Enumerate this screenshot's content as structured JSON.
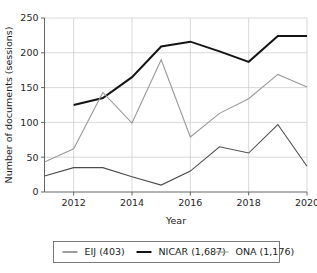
{
  "chart_data": {
    "type": "line",
    "title": "",
    "xlabel": "Year",
    "ylabel": "Number of documents (sessions)",
    "x": [
      2011,
      2012,
      2013,
      2014,
      2015,
      2016,
      2017,
      2018,
      2019,
      2020
    ],
    "xlim": [
      2011,
      2020
    ],
    "ylim": [
      0,
      250
    ],
    "xticks": [
      2012,
      2014,
      2016,
      2018,
      2020
    ],
    "xtick_labels": [
      "2012",
      "2014",
      "2016",
      "2018",
      "2020"
    ],
    "yticks": [
      0,
      50,
      100,
      150,
      200,
      250
    ],
    "ytick_labels": [
      "0",
      "50",
      "100",
      "150",
      "200",
      "250"
    ],
    "grid": true,
    "grid_axis": "both",
    "legend_position": "below-center",
    "series": [
      {
        "name": "EIJ (403)",
        "color": "#4d4d4d",
        "width": 1.1,
        "x": [
          2011,
          2012,
          2013,
          2014,
          2015,
          2016,
          2017,
          2018,
          2019,
          2020
        ],
        "values": [
          23,
          35,
          35,
          22,
          10,
          30,
          65,
          56,
          97,
          37
        ]
      },
      {
        "name": "NICAR (1,687)",
        "color": "#141414",
        "width": 2.0,
        "x": [
          2012,
          2013,
          2014,
          2015,
          2016,
          2017,
          2018,
          2019,
          2020
        ],
        "values": [
          125,
          135,
          165,
          209,
          216,
          202,
          187,
          224,
          224
        ]
      },
      {
        "name": "ONA (1,176)",
        "color": "#9a9a9a",
        "width": 1.1,
        "x": [
          2011,
          2012,
          2013,
          2014,
          2015,
          2016,
          2017,
          2018,
          2019,
          2020
        ],
        "values": [
          43,
          62,
          143,
          99,
          190,
          79,
          113,
          134,
          169,
          151
        ]
      }
    ]
  },
  "legend": {
    "entries": [
      {
        "label": "EIJ (403)"
      },
      {
        "label": "NICAR (1,687)"
      },
      {
        "label": "ONA (1,176)"
      }
    ]
  },
  "axes": {
    "x_title": "Year",
    "y_title": "Number of documents (sessions)"
  },
  "colors": {
    "grid": "#c9c9c9",
    "axis": "#555555",
    "text": "#1a1a1a",
    "background": "#ffffff"
  }
}
